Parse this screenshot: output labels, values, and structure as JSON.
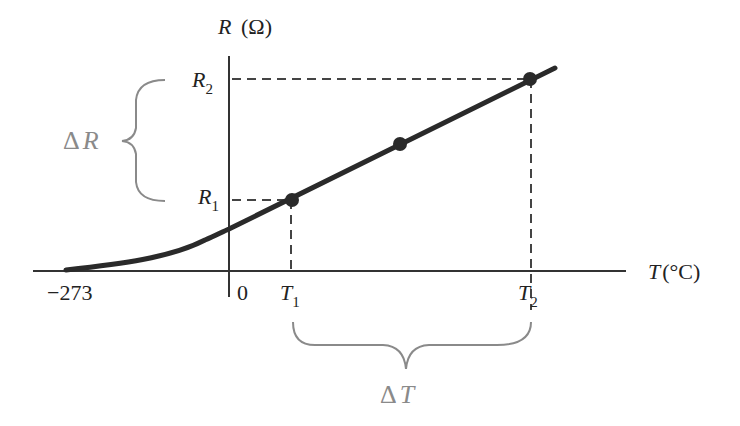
{
  "figure": {
    "y_axis_label": {
      "var": "R",
      "unit": "(Ω)"
    },
    "x_axis_label": {
      "var": "T",
      "unit": "(°C)"
    },
    "y_ticks": [
      {
        "main": "R",
        "sub": "2"
      },
      {
        "main": "R",
        "sub": "1"
      }
    ],
    "x_ticks": {
      "abs_zero": "−273",
      "zero": "0",
      "t1": {
        "main": "T",
        "sub": "1"
      },
      "t2": {
        "main": "T",
        "sub": "2"
      }
    },
    "delta_r": {
      "delta": "Δ",
      "var": "R"
    },
    "delta_t": {
      "delta": "Δ",
      "var": "T"
    },
    "colors": {
      "curve": "#2a2a2a",
      "axes": "#333333",
      "dashed": "#444444",
      "brace": "#8a8a8a"
    }
  }
}
